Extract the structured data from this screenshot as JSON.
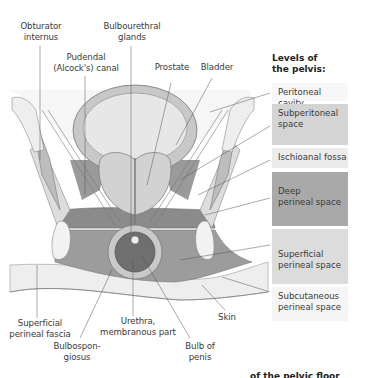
{
  "figure": {
    "top_labels": [
      {
        "id": "obturator-internus",
        "text": "Obturator\ninternus"
      },
      {
        "id": "pudendal-canal",
        "text": "Pudendal\n(Alcock's) canal"
      },
      {
        "id": "bulbourethral-glands",
        "text": "Bulbourethral\nglands"
      },
      {
        "id": "prostate",
        "text": "Prostate"
      },
      {
        "id": "bladder",
        "text": "Bladder"
      }
    ],
    "bottom_labels": [
      {
        "id": "superficial-perineal-fascia",
        "text": "Superficial\nperineal fascia"
      },
      {
        "id": "urethra-membranous-part",
        "text": "Urethra,\nmembranous part"
      },
      {
        "id": "skin",
        "text": "Skin"
      },
      {
        "id": "bulbospongiosus",
        "text": "Bulbospon-\ngiosus"
      },
      {
        "id": "bulb-of-penis",
        "text": "Bulb of\npenis"
      }
    ]
  },
  "legend": {
    "title": "Levels of\nthe pelvis:",
    "levels": [
      {
        "id": "peritoneal-cavity",
        "text": "Peritoneal cavity",
        "color": "#f7f7f7"
      },
      {
        "id": "subperitoneal-space",
        "text": "Subperitoneal\nspace",
        "color": "#d4d4d4"
      },
      {
        "id": "ischioanal-fossa",
        "text": "Ischioanal fossa",
        "color": "#ececec"
      },
      {
        "id": "deep-perineal-space",
        "text": "Deep\nperineal space",
        "color": "#a9a9a9"
      },
      {
        "id": "superficial-perineal-space",
        "text": "Superficial\nperineal space",
        "color": "#dcdcdc"
      },
      {
        "id": "subcutaneous-perineal-space",
        "text": "Subcutaneous\nperineal space",
        "color": "#f5f5f5"
      }
    ]
  },
  "footer_cut_text": "of the pelvic floor"
}
